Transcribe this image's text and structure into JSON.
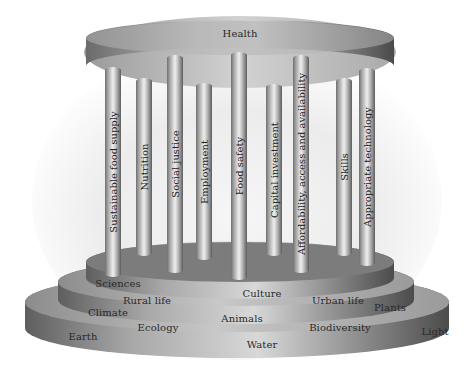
{
  "diagram": {
    "roof": {
      "label": "Health"
    },
    "pillars": [
      {
        "label": "Sustainable food supply",
        "x": 105,
        "w": 16,
        "top": 67,
        "bottom": 277
      },
      {
        "label": "Nutrition",
        "x": 136,
        "w": 16,
        "top": 78,
        "bottom": 256
      },
      {
        "label": "Social justice",
        "x": 167,
        "w": 16,
        "top": 55,
        "bottom": 273
      },
      {
        "label": "Employment",
        "x": 196,
        "w": 16,
        "top": 83,
        "bottom": 260
      },
      {
        "label": "Food safety",
        "x": 231,
        "w": 16,
        "top": 52,
        "bottom": 280
      },
      {
        "label": "Capital investment",
        "x": 266,
        "w": 16,
        "top": 84,
        "bottom": 256
      },
      {
        "label": "Affordability, access and availability",
        "x": 293,
        "w": 16,
        "top": 55,
        "bottom": 273
      },
      {
        "label": "Skills",
        "x": 336,
        "w": 16,
        "top": 78,
        "bottom": 256
      },
      {
        "label": "Appropriate technology",
        "x": 359,
        "w": 16,
        "top": 68,
        "bottom": 266
      }
    ],
    "tiers": [
      {
        "name": "upper-tier",
        "labels": [
          {
            "text": "Sciences",
            "x": 118,
            "y": 283
          },
          {
            "text": "Culture",
            "x": 262,
            "y": 293
          },
          {
            "text": "Urban life",
            "x": 338,
            "y": 300
          }
        ]
      },
      {
        "name": "middle-tier",
        "labels": [
          {
            "text": "Rural life",
            "x": 147,
            "y": 300
          },
          {
            "text": "Climate",
            "x": 108,
            "y": 312
          },
          {
            "text": "Animals",
            "x": 242,
            "y": 318
          },
          {
            "text": "Plants",
            "x": 390,
            "y": 307
          }
        ]
      },
      {
        "name": "base-tier",
        "labels": [
          {
            "text": "Ecology",
            "x": 158,
            "y": 327
          },
          {
            "text": "Biodiversity",
            "x": 340,
            "y": 327
          },
          {
            "text": "Earth",
            "x": 83,
            "y": 336
          },
          {
            "text": "Water",
            "x": 262,
            "y": 344
          },
          {
            "text": "Light",
            "x": 435,
            "y": 331
          }
        ]
      }
    ]
  }
}
